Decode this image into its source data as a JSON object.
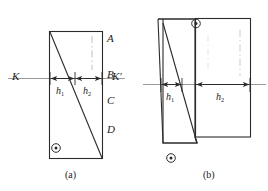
{
  "figure": {
    "title_alt": "Two-part schematic diagram with K-K' reference axis",
    "background_color": "#ffffff",
    "line_color": "#2b2b2b",
    "axis_color": "#8f8f8f",
    "text_color": "#1a1a1a"
  },
  "panel_a": {
    "caption": "(a)",
    "axis_label_left": "K",
    "axis_label_right": "K'",
    "edge_labels": [
      "A",
      "B",
      "C",
      "D"
    ],
    "dimensions": [
      {
        "name": "h1",
        "base": "h",
        "sub": "1"
      },
      {
        "name": "h2",
        "base": "h",
        "sub": "2"
      }
    ],
    "symbols": [
      {
        "name": "circle-dot",
        "glyph": "⊙"
      }
    ]
  },
  "panel_b": {
    "caption": "(b)",
    "dimensions": [
      {
        "name": "h1",
        "base": "h",
        "sub": "1"
      },
      {
        "name": "h2",
        "base": "h",
        "sub": "2"
      }
    ],
    "symbols": [
      {
        "name": "circle-dot-top",
        "glyph": "⊙"
      },
      {
        "name": "circle-dot-bottom",
        "glyph": "⊙"
      }
    ]
  }
}
